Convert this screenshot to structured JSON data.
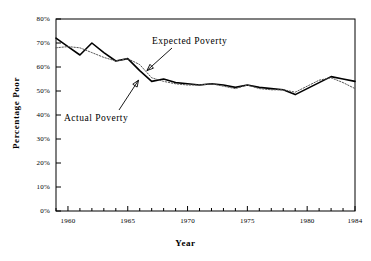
{
  "chart_data": {
    "type": "line",
    "title": "",
    "xlabel": "Year",
    "ylabel": "Percentage Poor",
    "xlim": [
      1959,
      1984
    ],
    "ylim": [
      0,
      80
    ],
    "grid": false,
    "legend": "annotations",
    "x_tick_labels": [
      "1960",
      "1965",
      "1970",
      "1975",
      "1980",
      "1984"
    ],
    "x_tick_values": [
      1960,
      1965,
      1970,
      1975,
      1980,
      1984
    ],
    "x_minor_tick_step": 1,
    "y_tick_labels": [
      "0%",
      "10%",
      "20%",
      "30%",
      "40%",
      "50%",
      "60%",
      "70%",
      "80%"
    ],
    "y_tick_values": [
      0,
      10,
      20,
      30,
      40,
      50,
      60,
      70,
      80
    ],
    "x": [
      1959,
      1960,
      1961,
      1962,
      1963,
      1964,
      1965,
      1966,
      1967,
      1968,
      1969,
      1970,
      1971,
      1972,
      1973,
      1974,
      1975,
      1976,
      1977,
      1978,
      1979,
      1980,
      1981,
      1982,
      1983,
      1984
    ],
    "series": [
      {
        "name": "Actual Poverty",
        "style": "solid",
        "color": "#000000",
        "values": [
          72.0,
          68.5,
          65.0,
          70.0,
          66.0,
          62.5,
          63.5,
          58.5,
          54.0,
          55.0,
          53.5,
          53.0,
          52.5,
          53.0,
          52.5,
          51.5,
          52.5,
          51.5,
          51.0,
          50.5,
          48.5,
          51.0,
          53.5,
          56.0,
          55.0,
          54.0
        ]
      },
      {
        "name": "Expected Poverty",
        "style": "dotted",
        "color": "#555555",
        "values": [
          68.0,
          68.5,
          68.0,
          66.0,
          64.0,
          62.5,
          63.5,
          61.0,
          55.5,
          54.0,
          53.0,
          52.5,
          52.5,
          53.0,
          52.0,
          51.0,
          52.5,
          51.0,
          50.5,
          50.5,
          49.5,
          52.0,
          54.5,
          55.5,
          53.5,
          51.0
        ]
      }
    ],
    "annotations": [
      {
        "text": "Expected Poverty",
        "target_x": 1966.6,
        "target_y": 58.5,
        "name": "expected-poverty-annotation"
      },
      {
        "text": "Actual Poverty",
        "target_x": 1965.9,
        "target_y": 54.5,
        "name": "actual-poverty-annotation"
      }
    ]
  },
  "axes": {
    "x_title": "Year",
    "y_title": "Percentage Poor"
  }
}
